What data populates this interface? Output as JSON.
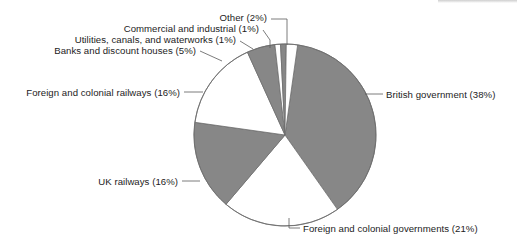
{
  "chart_data": {
    "type": "pie",
    "title": "",
    "subtitle": "",
    "xlabel": "",
    "ylabel": "",
    "legend_position": "none",
    "grid": false,
    "value_unit": "percent",
    "total": 100,
    "start_angle_deg": 8,
    "direction": "clockwise",
    "categories": [
      "British government",
      "Foreign and colonial governments",
      "UK railways",
      "Foreign and colonial railways",
      "Banks and discount houses",
      "Utilities, canals, and waterworks",
      "Commercial and industrial",
      "Other"
    ],
    "values": [
      38,
      21,
      16,
      16,
      5,
      1,
      1,
      2
    ],
    "slice_fills": [
      "#878787",
      "#ffffff",
      "#878787",
      "#ffffff",
      "#878787",
      "#ffffff",
      "#878787",
      "#ffffff"
    ],
    "labels": [
      {
        "text": "British government (38%)",
        "name": "British government",
        "value": 38,
        "side": "right"
      },
      {
        "text": "Foreign and colonial governments (21%)",
        "name": "Foreign and colonial governments",
        "value": 21,
        "side": "right"
      },
      {
        "text": "UK railways (16%)",
        "name": "UK railways",
        "value": 16,
        "side": "left"
      },
      {
        "text": "Foreign and colonial railways (16%)",
        "name": "Foreign and colonial railways",
        "value": 16,
        "side": "left"
      },
      {
        "text": "Banks and discount houses (5%)",
        "name": "Banks and discount houses",
        "value": 5,
        "side": "left"
      },
      {
        "text": "Utilities, canals, and waterworks (1%)",
        "name": "Utilities, canals, and waterworks",
        "value": 1,
        "side": "left"
      },
      {
        "text": "Commercial and industrial (1%)",
        "name": "Commercial and industrial",
        "value": 1,
        "side": "left"
      },
      {
        "text": "Other (2%)",
        "name": "Other",
        "value": 2,
        "side": "left"
      }
    ]
  },
  "colors": {
    "slice_gray": "#878787",
    "slice_white": "#ffffff",
    "outline": "#6e6e6e",
    "leader_line": "#5a5a5a",
    "text": "#1c1c1c",
    "background": "#ffffff"
  }
}
